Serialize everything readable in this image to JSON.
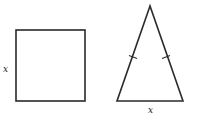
{
  "diagram": {
    "colors": {
      "stroke": "#2a2a2a",
      "background": "#ffffff",
      "text": "#222222"
    },
    "square": {
      "x": 16,
      "y": 30,
      "width": 69,
      "height": 71,
      "side_label": "x"
    },
    "triangle": {
      "type": "isosceles",
      "apex": [
        150,
        6
      ],
      "base_left": [
        117,
        101
      ],
      "base_right": [
        183,
        101
      ],
      "base_label": "x",
      "equal_side_tick_marks": 2
    }
  }
}
